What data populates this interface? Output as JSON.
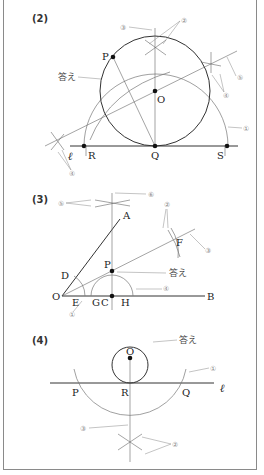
{
  "diagram": {
    "type": "geometry-construction-answers",
    "sections": [
      {
        "id": "2",
        "label": "(2)",
        "points": {
          "P": "P",
          "O": "O",
          "Q": "Q",
          "R": "R",
          "S": "S"
        },
        "line_label": "ℓ",
        "answer_label": "答え",
        "step_markers": [
          "①",
          "②",
          "③",
          "④",
          "⑤"
        ]
      },
      {
        "id": "3",
        "label": "(3)",
        "points": {
          "O": "O",
          "A": "A",
          "B": "B",
          "D": "D",
          "E": "E",
          "G": "G",
          "C": "C",
          "H": "H",
          "P": "P",
          "F": "F"
        },
        "answer_label": "答え",
        "step_markers": [
          "①",
          "②",
          "③",
          "④",
          "⑤",
          "⑥"
        ]
      },
      {
        "id": "4",
        "label": "(4)",
        "points": {
          "O": "O",
          "P": "P",
          "R": "R",
          "Q": "Q"
        },
        "line_label": "ℓ",
        "answer_label": "答え",
        "step_markers": [
          "①",
          "②",
          "③"
        ]
      }
    ]
  }
}
